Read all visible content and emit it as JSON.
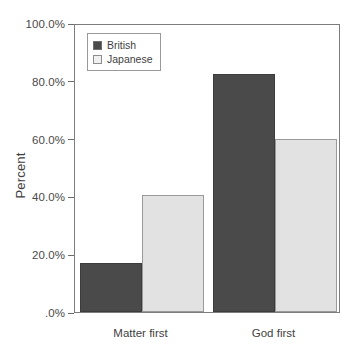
{
  "chart_data": {
    "type": "bar",
    "title": "",
    "subtitle": "",
    "xlabel": "",
    "ylabel": "Percent",
    "categories": [
      "Matter first",
      "God first"
    ],
    "series": [
      {
        "name": "British",
        "values": [
          17.0,
          82.5
        ],
        "color": "#4a4a4a"
      },
      {
        "name": "Japanese",
        "values": [
          40.5,
          60.0
        ],
        "color": "#e2e2e2"
      }
    ],
    "ylim": [
      0,
      100
    ],
    "ytick_values": [
      0,
      20,
      40,
      60,
      80,
      100
    ],
    "ytick_labels": [
      ".0%",
      "20.0%",
      "40.0%",
      "60.0%",
      "80.0%",
      "100.0%"
    ],
    "grid": false,
    "legend_position": "top-left-inside",
    "axis_frame": true,
    "value_unit": "percent"
  },
  "legend": {
    "entries": [
      {
        "label": "British"
      },
      {
        "label": "Japanese"
      }
    ]
  },
  "axes": {
    "y_title": "Percent"
  }
}
